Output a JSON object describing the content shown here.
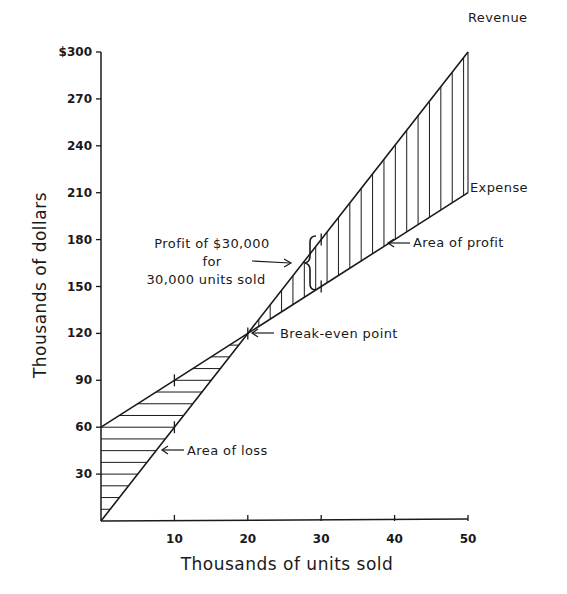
{
  "chart_data": {
    "type": "line",
    "title": "",
    "xlabel": "Thousands of units sold",
    "ylabel": "Thousands of dollars",
    "xlim": [
      0,
      50
    ],
    "ylim": [
      0,
      300
    ],
    "grid": false,
    "x_ticks": [
      10,
      20,
      30,
      40,
      50
    ],
    "x_tick_labels": [
      "10",
      "20",
      "30",
      "40",
      "50"
    ],
    "y_ticks": [
      30,
      60,
      90,
      120,
      150,
      180,
      210,
      240,
      270,
      300
    ],
    "y_tick_labels": [
      "30",
      "60",
      "90",
      "120",
      "150",
      "180",
      "210",
      "240",
      "270",
      "$300"
    ],
    "x": [
      0,
      10,
      20,
      30,
      40,
      50
    ],
    "series": [
      {
        "name": "Revenue",
        "values": [
          0,
          60,
          120,
          180,
          240,
          300
        ]
      },
      {
        "name": "Expense",
        "values": [
          60,
          90,
          120,
          150,
          180,
          210
        ]
      }
    ],
    "regions": [
      {
        "name": "Area of loss",
        "from_x": 0,
        "to_x": 20,
        "hatch": "horizontal"
      },
      {
        "name": "Area of profit",
        "from_x": 20,
        "to_x": 50,
        "hatch": "vertical"
      }
    ],
    "annotations": [
      {
        "text": "Break-even point",
        "x": 20,
        "y": 120
      },
      {
        "text": "Area of profit",
        "x": 40,
        "y": 180
      },
      {
        "text": "Area of loss",
        "x": 9,
        "y": 54
      },
      {
        "lines": [
          "Profit of $30,000",
          "for",
          "30,000 units sold"
        ],
        "x": 30,
        "y_from": 150,
        "y_to": 180
      }
    ],
    "legend_position": "none"
  },
  "labels": {
    "revenue": "Revenue",
    "expense": "Expense",
    "break_even": "Break-even point",
    "area_profit": "Area of profit",
    "area_loss": "Area of loss",
    "profit_line1": "Profit of $30,000",
    "profit_line2": "for",
    "profit_line3": "30,000 units sold"
  }
}
